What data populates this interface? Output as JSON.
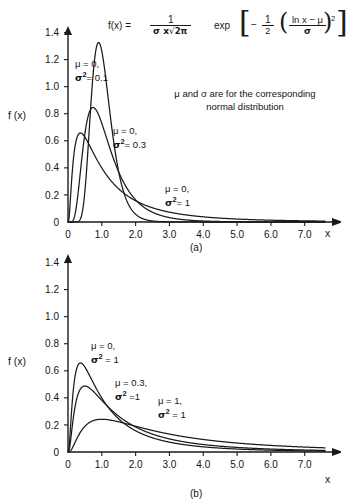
{
  "figure": {
    "formula": {
      "lhs": "f(x)  =",
      "frac_numerator": "1",
      "frac_denominator_sigma_x": "σ x",
      "frac_denominator_root": "√",
      "frac_denominator_inner": "2π",
      "exp_label": "exp",
      "bracket_open": "[",
      "bracket_close": "]",
      "minus": "−",
      "half_numerator": "1",
      "half_denominator": "2",
      "paren_open": "(",
      "paren_close": ")",
      "inner_numerator": "ln x  −  μ",
      "inner_denominator": "σ",
      "power": "2"
    },
    "note_line1": "μ and σ are for the corresponding",
    "note_line2": "normal distribution",
    "panel_a": {
      "caption": "(a)",
      "y_axis_label": "f (x)",
      "x_axis_label": "x",
      "annotations": [
        {
          "line1_mu": "μ = 0,",
          "line2_sigma": "σ",
          "line2_sup": "2",
          "line2_val": "= 0.1"
        },
        {
          "line1_mu": "μ = 0,",
          "line2_sigma": "σ",
          "line2_sup": "2",
          "line2_val": "= 0.3"
        },
        {
          "line1_mu": "μ = 0,",
          "line2_sigma": "σ",
          "line2_sup": "2",
          "line2_val": "= 1"
        }
      ]
    },
    "panel_b": {
      "caption": "(b)",
      "y_axis_label": "f (x)",
      "x_axis_label": "x",
      "annotations": [
        {
          "line1_mu": "μ  = 0,",
          "line2_sigma": "σ",
          "line2_sup": "2",
          "line2_val": " = 1"
        },
        {
          "line1_mu": "μ  = 0.3,",
          "line2_sigma": "σ",
          "line2_sup": "2",
          "line2_val": " =1"
        },
        {
          "line1_mu": "μ  = 1,",
          "line2_sigma": "σ",
          "line2_sup": "2",
          "line2_val": " = 1"
        }
      ]
    }
  },
  "chart_data": [
    {
      "id": "panel-a",
      "type": "line",
      "title": "",
      "subtitle": "(a)",
      "xlabel": "x",
      "ylabel": "f (x)",
      "xlim": [
        0,
        7.6
      ],
      "ylim": [
        0,
        1.5
      ],
      "xticks": [
        0,
        1.0,
        2.0,
        3.0,
        4.0,
        5.0,
        6.0,
        7.0
      ],
      "xtick_labels": [
        "0",
        "1.0",
        "2.0",
        "3.0",
        "4.0",
        "5.0",
        "6.0",
        "7.0"
      ],
      "yticks": [
        0,
        0.2,
        0.4,
        0.6,
        0.8,
        1.0,
        1.2,
        1.4
      ],
      "ytick_labels": [
        "0",
        "0.2",
        "0.4",
        "0.6",
        "0.8",
        "1.0",
        "1.2",
        "1.4"
      ],
      "grid": false,
      "legend": "annotations",
      "distribution": "lognormal",
      "series": [
        {
          "name": "μ = 0, σ² = 0.1",
          "mu": 0,
          "sigma2": 0.1,
          "peak_x": 0.9,
          "peak_y": 1.31,
          "color": "#1a1a1a"
        },
        {
          "name": "μ = 0, σ² = 0.3",
          "mu": 0,
          "sigma2": 0.3,
          "peak_x": 0.74,
          "peak_y": 0.85,
          "color": "#1a1a1a"
        },
        {
          "name": "μ = 0, σ² = 1",
          "mu": 0,
          "sigma2": 1.0,
          "peak_x": 0.37,
          "peak_y": 0.66,
          "color": "#1a1a1a"
        }
      ]
    },
    {
      "id": "panel-b",
      "type": "line",
      "title": "",
      "subtitle": "(b)",
      "xlabel": "x",
      "ylabel": "f (x)",
      "xlim": [
        0,
        7.6
      ],
      "ylim": [
        0,
        1.5
      ],
      "xticks": [
        0,
        1.0,
        2.0,
        3.0,
        4.0,
        5.0,
        6.0,
        7.0
      ],
      "xtick_labels": [
        "0",
        "1.0",
        "2.0",
        "3.0",
        "4.0",
        "5.0",
        "6.0",
        "7.0"
      ],
      "yticks": [
        0,
        0.2,
        0.4,
        0.6,
        0.8,
        1.0,
        1.2,
        1.4
      ],
      "ytick_labels": [
        "0",
        "0.2",
        "0.4",
        "0.6",
        "0.8",
        "1.0",
        "1.2",
        "1.4"
      ],
      "grid": false,
      "legend": "annotations",
      "distribution": "lognormal",
      "series": [
        {
          "name": "μ = 0, σ² = 1",
          "mu": 0.0,
          "sigma2": 1.0,
          "peak_x": 0.37,
          "peak_y": 0.66,
          "color": "#1a1a1a"
        },
        {
          "name": "μ = 0.3, σ² = 1",
          "mu": 0.3,
          "sigma2": 1.0,
          "peak_x": 0.5,
          "peak_y": 0.49,
          "color": "#1a1a1a"
        },
        {
          "name": "μ = 1, σ² = 1",
          "mu": 1.0,
          "sigma2": 1.0,
          "peak_x": 1.0,
          "peak_y": 0.24,
          "color": "#1a1a1a"
        }
      ]
    }
  ]
}
